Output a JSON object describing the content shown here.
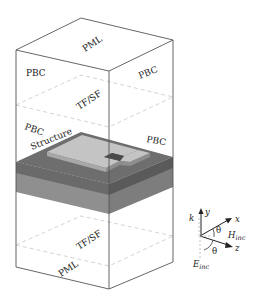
{
  "diagram": {
    "type": "FDTD simulation domain schematic",
    "box_labels": {
      "top": "PML",
      "bottom": "PML",
      "left_upper": "PBC",
      "right_upper": "PBC",
      "left_middle": "PBC",
      "right_middle": "PBC",
      "tfsf_upper": "TF/SF",
      "tfsf_lower": "TF/SF",
      "structure": "Structure"
    },
    "axes": {
      "y": "y",
      "x": "x",
      "z": "z",
      "k": "k",
      "theta_upper": "θ",
      "theta_lower": "θ",
      "h_main": "H",
      "h_sub": "inc",
      "e_main": "E",
      "e_sub": "inc"
    },
    "colors": {
      "box_line": "#555555",
      "dashed_line": "#c8c8c8",
      "slab_dark": "#6e6e6e",
      "slab_mid": "#9a9a9a",
      "slab_side_dark": "#5a5a5a",
      "slab_side_mid": "#8a8a8a",
      "structure_light": "#c4c4c4",
      "notch_dark": "#4a4a4a"
    }
  }
}
